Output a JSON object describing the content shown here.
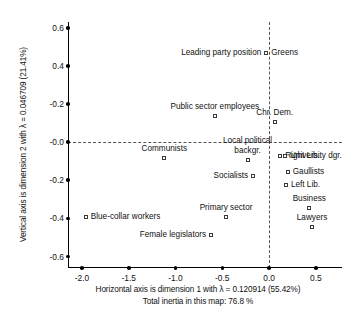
{
  "chart_data": {
    "type": "scatter",
    "title": "",
    "xlabel": "Horizontal axis is dimension 1 with λ = 0.120914 (55.42%)",
    "xlabel_line2": "Total inertia in this map: 76.8 %",
    "ylabel": "Vertical axis is dimension 2 with λ = 0.046709  (21.41%)",
    "xlim": [
      -2.15,
      0.78
    ],
    "ylim": [
      -0.66,
      0.63
    ],
    "xticks": [
      -2.0,
      -1.5,
      -1.0,
      -0.5,
      0.0,
      0.5
    ],
    "xticklabels": [
      "-2.0",
      "-1.5",
      "-1.0",
      "-0.5",
      "0.0",
      "0.5"
    ],
    "yticks": [
      0.6,
      0.4,
      0.2,
      0.0,
      -0.2,
      -0.4,
      -0.6
    ],
    "yticklabels": [
      "0.6",
      "0.4",
      "-0.2",
      "-0.0",
      "-0.2",
      "-0.4",
      "-0.6"
    ],
    "grid": false,
    "legend": "none",
    "reference_lines": {
      "x": 0.0,
      "y": 0.0,
      "style": "dashed"
    },
    "points": [
      {
        "label": "Leading party position",
        "x": -0.03,
        "y": 0.47,
        "label_pos": "left"
      },
      {
        "label": "Greens",
        "x": -0.03,
        "y": 0.47,
        "label_pos": "right"
      },
      {
        "label": "Public sector employees",
        "x": -0.58,
        "y": 0.135,
        "label_pos": "above"
      },
      {
        "label": "Chr. Dem.",
        "x": 0.06,
        "y": 0.105,
        "label_pos": "above"
      },
      {
        "label": "Communists",
        "x": -1.12,
        "y": -0.085,
        "label_pos": "above"
      },
      {
        "label": "Local political\nbackgr.",
        "x": -0.23,
        "y": -0.095,
        "label_pos": "above"
      },
      {
        "label": "Right Lib.",
        "x": 0.12,
        "y": -0.075,
        "label_pos": "right"
      },
      {
        "label": "University dgr.",
        "x": 0.17,
        "y": -0.075,
        "label_pos": "right"
      },
      {
        "label": "Gaullists",
        "x": 0.2,
        "y": -0.155,
        "label_pos": "right"
      },
      {
        "label": "Left Lib.",
        "x": 0.18,
        "y": -0.225,
        "label_pos": "right"
      },
      {
        "label": "Socialists",
        "x": -0.17,
        "y": -0.175,
        "label_pos": "left"
      },
      {
        "label": "Business",
        "x": 0.43,
        "y": -0.345,
        "label_pos": "above"
      },
      {
        "label": "Lawyers",
        "x": 0.46,
        "y": -0.445,
        "label_pos": "above"
      },
      {
        "label": "Blue-collar workers",
        "x": -1.96,
        "y": -0.395,
        "label_pos": "right"
      },
      {
        "label": "Primary sector",
        "x": -0.46,
        "y": -0.395,
        "label_pos": "above"
      },
      {
        "label": "Female legislators",
        "x": -0.62,
        "y": -0.485,
        "label_pos": "left"
      }
    ]
  },
  "colors": {
    "axis": "#000000",
    "reference_line": "#555555",
    "marker_edge": "#3a3a3a",
    "marker_fill": "#ffffff",
    "text": "#111111",
    "background": "#ffffff"
  }
}
